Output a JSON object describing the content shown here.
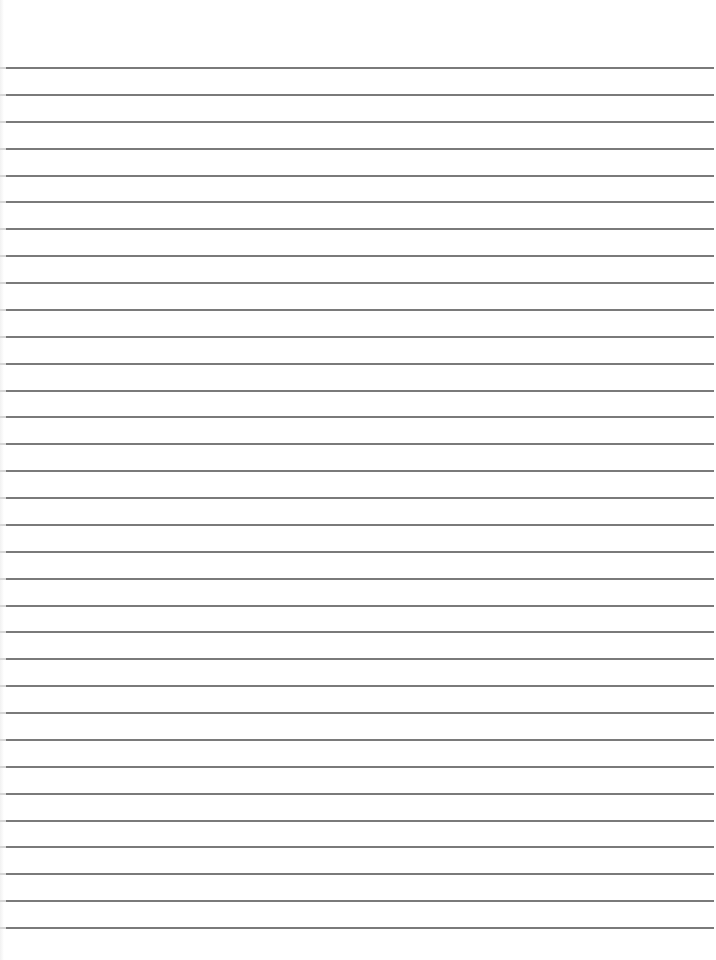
{
  "paper": {
    "type": "lined-paper",
    "background_color": "#ffffff",
    "line_color": "#7a7a7a",
    "line_count": 33,
    "first_line_y": 67,
    "line_spacing": 26.875,
    "line_left": 6,
    "line_right": 714
  }
}
